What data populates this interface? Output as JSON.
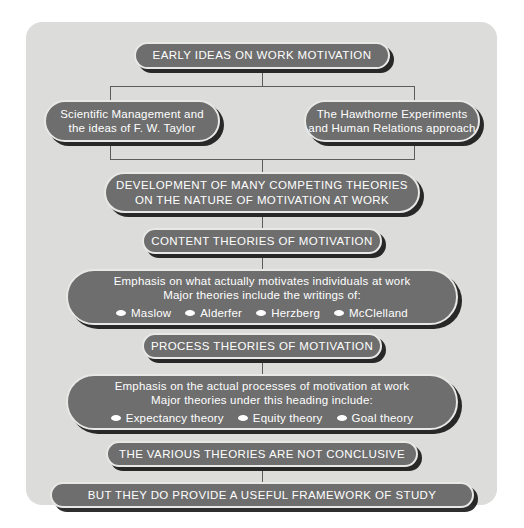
{
  "panel": {
    "background_color": "#dcdcda",
    "node_fill_color": "#6e6e6e",
    "node_text_color": "#ffffff",
    "node_border_color": "#e8e8e6",
    "connector_color": "#5c5c5c"
  },
  "nodes": {
    "root": {
      "line1": "EARLY IDEAS ON WORK MOTIVATION"
    },
    "branch_left": {
      "line1": "Scientific Management and",
      "line2": "the ideas of F. W. Taylor"
    },
    "branch_right": {
      "line1": "The Hawthorne Experiments",
      "line2": "and Human Relations approach"
    },
    "development": {
      "line1": "DEVELOPMENT OF MANY COMPETING THEORIES",
      "line2": "ON THE NATURE OF MOTIVATION AT WORK"
    },
    "content_heading": {
      "line1": "CONTENT THEORIES OF MOTIVATION"
    },
    "content_detail": {
      "line1": "Emphasis on what actually motivates individuals at work",
      "line2": "Major theories include the writings of:",
      "bullets": [
        "Maslow",
        "Alderfer",
        "Herzberg",
        "McClelland"
      ]
    },
    "process_heading": {
      "line1": "PROCESS THEORIES OF MOTIVATION"
    },
    "process_detail": {
      "line1": "Emphasis on the actual processes of motivation at work",
      "line2": "Major theories under this heading include:",
      "bullets": [
        "Expectancy theory",
        "Equity theory",
        "Goal theory"
      ]
    },
    "conclusion_one": {
      "line1": "THE VARIOUS THEORIES ARE NOT CONCLUSIVE"
    },
    "conclusion_two": {
      "line1": "BUT THEY DO PROVIDE A USEFUL FRAMEWORK OF STUDY"
    }
  }
}
